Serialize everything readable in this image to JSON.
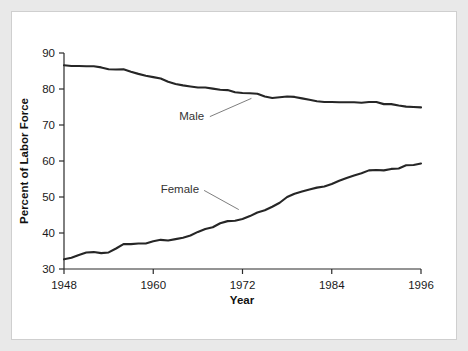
{
  "figure": {
    "background_color": "#e9e9e9",
    "panel_color": "#ffffff",
    "panel_border_color": "#cfcfcf"
  },
  "chart_data": {
    "type": "line",
    "title": "",
    "xlabel": "Year",
    "ylabel": "Percent of Labor Force",
    "xlim": [
      1948,
      1996
    ],
    "ylim": [
      30,
      90
    ],
    "xticks": [
      1948,
      1960,
      1972,
      1984,
      1996
    ],
    "xtick_labels": [
      "1948",
      "1960",
      "1972",
      "1984",
      "1996"
    ],
    "yticks": [
      30,
      40,
      50,
      60,
      70,
      80,
      90
    ],
    "ytick_labels": [
      "30",
      "40",
      "50",
      "60",
      "70",
      "80",
      "90"
    ],
    "grid": false,
    "legend": "inline-annotations",
    "line_color": "#262626",
    "x": [
      1948,
      1949,
      1950,
      1951,
      1952,
      1953,
      1954,
      1955,
      1956,
      1957,
      1958,
      1959,
      1960,
      1961,
      1962,
      1963,
      1964,
      1965,
      1966,
      1967,
      1968,
      1969,
      1970,
      1971,
      1972,
      1973,
      1974,
      1975,
      1976,
      1977,
      1978,
      1979,
      1980,
      1981,
      1982,
      1983,
      1984,
      1985,
      1986,
      1987,
      1988,
      1989,
      1990,
      1991,
      1992,
      1993,
      1994,
      1995,
      1996
    ],
    "series": [
      {
        "name": "Male",
        "label": "Male",
        "values": [
          86.6,
          86.4,
          86.4,
          86.3,
          86.3,
          86.0,
          85.5,
          85.4,
          85.5,
          84.8,
          84.2,
          83.7,
          83.3,
          82.9,
          82.0,
          81.4,
          81.0,
          80.7,
          80.4,
          80.4,
          80.1,
          79.8,
          79.7,
          79.1,
          78.9,
          78.8,
          78.7,
          77.9,
          77.5,
          77.7,
          77.9,
          77.8,
          77.4,
          77.0,
          76.6,
          76.4,
          76.4,
          76.3,
          76.3,
          76.3,
          76.2,
          76.4,
          76.4,
          75.8,
          75.8,
          75.4,
          75.1,
          75.0,
          74.9
        ]
      },
      {
        "name": "Female",
        "label": "Female",
        "values": [
          32.7,
          33.1,
          33.9,
          34.6,
          34.7,
          34.4,
          34.6,
          35.7,
          36.9,
          36.9,
          37.1,
          37.1,
          37.7,
          38.1,
          37.9,
          38.3,
          38.7,
          39.3,
          40.3,
          41.1,
          41.6,
          42.7,
          43.3,
          43.4,
          43.9,
          44.7,
          45.7,
          46.3,
          47.3,
          48.4,
          50.0,
          50.9,
          51.5,
          52.1,
          52.6,
          52.9,
          53.6,
          54.5,
          55.3,
          56.0,
          56.6,
          57.4,
          57.5,
          57.4,
          57.8,
          57.9,
          58.8,
          58.9,
          59.3
        ]
      }
    ],
    "annotations": [
      {
        "name": "male-series-label",
        "text": "Male",
        "x_label": 1963.5,
        "y_label": 71.5,
        "leader_to_x": 1973.2,
        "leader_to_y": 77.4
      },
      {
        "name": "female-series-label",
        "text": "Female",
        "x_label": 1961.0,
        "y_label": 51.0,
        "leader_to_x": 1971.5,
        "leader_to_y": 46.5
      }
    ]
  }
}
